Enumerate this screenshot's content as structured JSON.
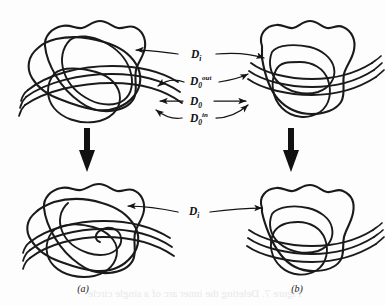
{
  "figure": {
    "type": "mathematical-diagram",
    "background_color": "#fdfdfd",
    "ink_color": "#1a1a1a"
  },
  "labels": {
    "d_i_top": {
      "base": "D",
      "sub": "i",
      "sup": ""
    },
    "d0_out": {
      "base": "D",
      "sub": "0",
      "sup": "out"
    },
    "d0": {
      "base": "D",
      "sub": "0",
      "sup": ""
    },
    "d0_in": {
      "base": "D",
      "sub": "0",
      "sup": "in"
    },
    "d_i_bottom": {
      "base": "D",
      "sub": "i",
      "sup": ""
    }
  },
  "captions": {
    "left": "(a)",
    "right": "(b)"
  },
  "panels": [
    {
      "id": "top-left",
      "name": "panel-a-before",
      "caption_ref": "(a)"
    },
    {
      "id": "top-right",
      "name": "panel-b-before",
      "caption_ref": "(b)"
    },
    {
      "id": "bottom-left",
      "name": "panel-a-after",
      "caption_ref": "(a)"
    },
    {
      "id": "bottom-right",
      "name": "panel-b-after",
      "caption_ref": "(b)"
    }
  ],
  "connectors": [
    {
      "name": "d-i-top-connector",
      "style": "double-headed",
      "label": "D_i"
    },
    {
      "name": "d0-out-connector",
      "style": "double-headed",
      "label": "D_0^out"
    },
    {
      "name": "d0-connector",
      "style": "double-headed",
      "label": "D_0"
    },
    {
      "name": "d0-in-connector",
      "style": "double-headed",
      "label": "D_0^in"
    },
    {
      "name": "d-i-bottom-connector",
      "style": "double-headed",
      "label": "D_i"
    }
  ],
  "transform_arrows": [
    {
      "name": "left-transform-arrow",
      "direction": "down"
    },
    {
      "name": "right-transform-arrow",
      "direction": "down"
    }
  ],
  "bleedthrough": {
    "visible": true,
    "text": "Figure 7. Deleting the inner arc of a single circle"
  }
}
